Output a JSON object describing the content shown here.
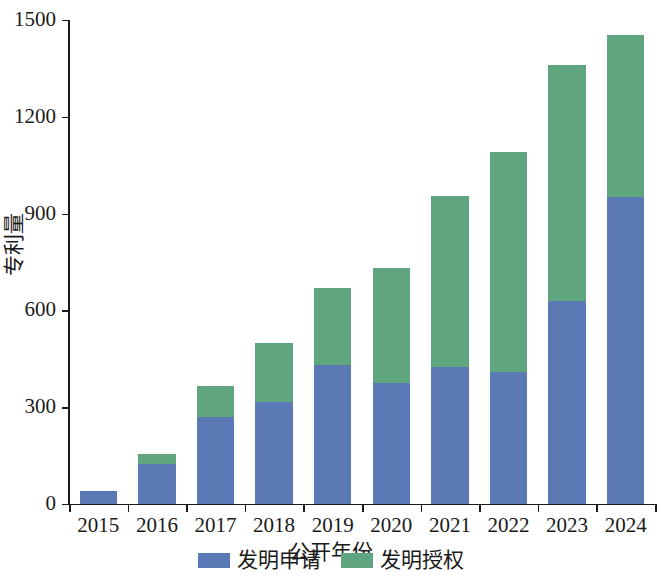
{
  "chart_data": {
    "type": "bar",
    "stacked": true,
    "title": "",
    "xlabel": "公开年份",
    "ylabel": "专利量",
    "categories": [
      "2015",
      "2016",
      "2017",
      "2018",
      "2019",
      "2020",
      "2021",
      "2022",
      "2023",
      "2024"
    ],
    "series": [
      {
        "name": "发明申请",
        "color": "#5b79b5",
        "values": [
          40,
          125,
          270,
          315,
          430,
          375,
          425,
          410,
          630,
          950
        ]
      },
      {
        "name": "发明授权",
        "color": "#5fa57f",
        "values": [
          0,
          30,
          95,
          185,
          240,
          355,
          530,
          680,
          730,
          505
        ]
      }
    ],
    "totals": [
      40,
      155,
      365,
      500,
      670,
      730,
      955,
      1090,
      1360,
      1455
    ],
    "ylim": [
      0,
      1500
    ],
    "yticks": [
      0,
      300,
      600,
      900,
      1200,
      1500
    ],
    "ytick_labels": [
      "0",
      "300",
      "600",
      "900",
      "1200",
      "1500"
    ],
    "grid": false,
    "legend_position": "bottom-center"
  },
  "legend": {
    "items": [
      {
        "label": "发明申请",
        "color": "#5b79b5"
      },
      {
        "label": "发明授权",
        "color": "#5fa57f"
      }
    ]
  },
  "axes": {
    "x_title": "公开年份",
    "y_title": "专利量"
  }
}
